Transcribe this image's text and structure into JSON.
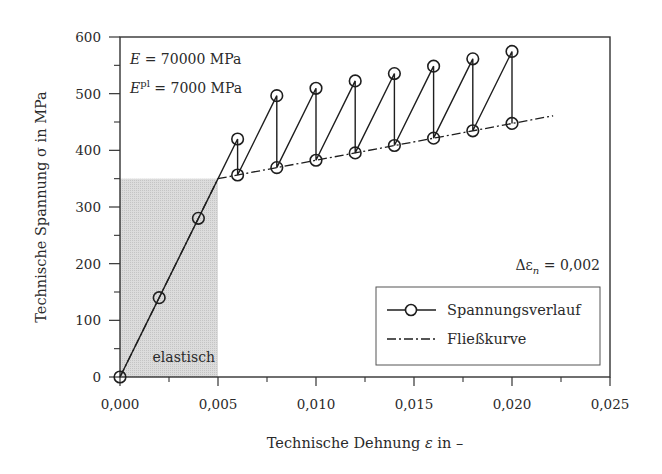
{
  "chart_data": {
    "type": "line",
    "title": "",
    "xlabel": "Technische Dehnung ε in –",
    "ylabel": "Technische Spannung σ in MPa",
    "xlim": [
      0,
      0.025
    ],
    "ylim": [
      0,
      600
    ],
    "x_ticks": [
      0,
      0.005,
      0.01,
      0.015,
      0.02,
      0.025
    ],
    "x_tick_labels": [
      "0,000",
      "0,005",
      "0,010",
      "0,015",
      "0,020",
      "0,025"
    ],
    "x_minor_ticks": [
      0.0025,
      0.0075,
      0.0125,
      0.0175,
      0.0225
    ],
    "y_ticks": [
      0,
      100,
      200,
      300,
      400,
      500,
      600
    ],
    "y_tick_labels": [
      "0",
      "100",
      "200",
      "300",
      "400",
      "500",
      "600"
    ],
    "y_minor_ticks": [
      50,
      150,
      250,
      350,
      450,
      550
    ],
    "grid": false,
    "legend_position": "lower right",
    "series": [
      {
        "name": "Spannungsverlauf",
        "style": "solid line with circle markers",
        "x": [
          0,
          0.002,
          0.004,
          0.006,
          0.006,
          0.008,
          0.008,
          0.01,
          0.01,
          0.012,
          0.012,
          0.014,
          0.014,
          0.016,
          0.016,
          0.018,
          0.018,
          0.02,
          0.02
        ],
        "y": [
          0,
          140,
          280,
          420,
          356.5,
          496.5,
          369.5,
          509.5,
          382.5,
          522.5,
          395.5,
          535.5,
          408.5,
          548.5,
          421.5,
          561.5,
          434.5,
          574.5,
          447.5
        ]
      },
      {
        "name": "Fließkurve",
        "style": "dash-dot line",
        "x": [
          0,
          0.005,
          0.0221
        ],
        "y": [
          0,
          350,
          461
        ]
      }
    ],
    "shaded_regions": [
      {
        "label": "elastisch",
        "x": [
          0,
          0.005
        ],
        "y": [
          0,
          350
        ],
        "color": "#d6d6d6"
      }
    ],
    "annotations": [
      {
        "text": "E = 70000 MPa",
        "position": "upper left"
      },
      {
        "text": "E^pl = 7000 MPa",
        "position": "upper left"
      },
      {
        "text": "Δε_n = 0,002",
        "position": "right, above legend"
      }
    ]
  },
  "labels": {
    "ylabel": "Technische Spannung σ in MPa",
    "xlabel_main": "Technische Dehnung ",
    "xlabel_symbol": "ε",
    "xlabel_unit": " in –",
    "annot_E_sym": "E",
    "annot_E_val": " = 70000 MPa",
    "annot_Epl_sym": "E",
    "annot_Epl_sup": "pl",
    "annot_Epl_val": " = 7000 MPa",
    "annot_delta": "Δε",
    "annot_delta_sub": "n",
    "annot_delta_val": " = 0,002",
    "elastic_label": "elastisch",
    "legend_1": "Spannungsverlauf",
    "legend_2": "Fließkurve"
  },
  "colors": {
    "ink": "#1e1e1e",
    "frame": "#333333",
    "shade": "#d6d6d6"
  }
}
